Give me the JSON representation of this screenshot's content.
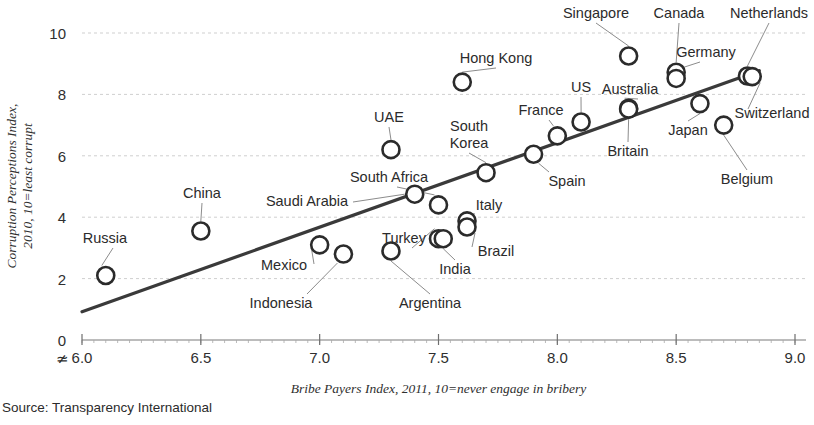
{
  "source_note": "Source: Transparency International",
  "chart_data": {
    "type": "scatter",
    "title": "",
    "xlabel": "Bribe Payers Index, 2011, 10=never engage in bribery",
    "ylabel": "Corruption Perceptions Index, 2010, 10=least corrupt",
    "ylabel_line1": "Corruption Perceptions Index,",
    "ylabel_line2": "2010, 10=least corrupt",
    "xlim": [
      6.0,
      9.0
    ],
    "ylim": [
      0,
      10
    ],
    "xticks": [
      "6.0",
      "6.5",
      "7.0",
      "7.5",
      "8.0",
      "8.5",
      "9.0"
    ],
    "xtick_values": [
      6.0,
      6.5,
      7.0,
      7.5,
      8.0,
      8.5,
      9.0
    ],
    "yticks": [
      "0",
      "2",
      "4",
      "6",
      "8",
      "10"
    ],
    "ytick_values": [
      0,
      2,
      4,
      6,
      8,
      10
    ],
    "grid": true,
    "axis_break": true,
    "legend": "none",
    "trendline": {
      "x": [
        6.0,
        8.85
      ],
      "y": [
        0.92,
        8.77
      ]
    },
    "points": [
      {
        "label": "Russia",
        "x": 6.1,
        "y": 2.1,
        "label_pos": "above-left"
      },
      {
        "label": "China",
        "x": 6.5,
        "y": 3.55,
        "label_pos": "above"
      },
      {
        "label": "Mexico",
        "x": 7.0,
        "y": 3.1,
        "label_pos": "left-below"
      },
      {
        "label": "Indonesia",
        "x": 7.1,
        "y": 2.8,
        "label_pos": "below-left"
      },
      {
        "label": "UAE",
        "x": 7.3,
        "y": 6.2,
        "label_pos": "above"
      },
      {
        "label": "Argentina",
        "x": 7.3,
        "y": 2.9,
        "label_pos": "below"
      },
      {
        "label": "Saudi Arabia",
        "x": 7.4,
        "y": 4.75,
        "label_pos": "left"
      },
      {
        "label": "South Africa",
        "x": 7.5,
        "y": 4.4,
        "label_pos": "above-left"
      },
      {
        "label": "Turkey",
        "x": 7.5,
        "y": 3.3,
        "label_pos": "above-left"
      },
      {
        "label": "India",
        "x": 7.52,
        "y": 3.3,
        "label_pos": "below"
      },
      {
        "label": "Hong Kong",
        "x": 7.6,
        "y": 8.4,
        "label_pos": "above"
      },
      {
        "label": "Italy",
        "x": 7.62,
        "y": 3.88,
        "label_pos": "right-above"
      },
      {
        "label": "Brazil",
        "x": 7.62,
        "y": 3.68,
        "label_pos": "right-below"
      },
      {
        "label": "South Korea",
        "x": 7.7,
        "y": 5.45,
        "label_pos": "above"
      },
      {
        "label": "Spain",
        "x": 7.9,
        "y": 6.05,
        "label_pos": "below-right"
      },
      {
        "label": "France",
        "x": 8.0,
        "y": 6.65,
        "label_pos": "above-left"
      },
      {
        "label": "US",
        "x": 8.1,
        "y": 7.1,
        "label_pos": "above"
      },
      {
        "label": "Singapore",
        "x": 8.3,
        "y": 9.25,
        "label_pos": "above"
      },
      {
        "label": "Australia",
        "x": 8.3,
        "y": 7.55,
        "label_pos": "above-left"
      },
      {
        "label": "Britain",
        "x": 8.3,
        "y": 7.52,
        "label_pos": "below"
      },
      {
        "label": "Canada",
        "x": 8.5,
        "y": 8.72,
        "label_pos": "above"
      },
      {
        "label": "Germany",
        "x": 8.5,
        "y": 8.52,
        "label_pos": "above-right"
      },
      {
        "label": "Japan",
        "x": 8.6,
        "y": 7.7,
        "label_pos": "below"
      },
      {
        "label": "Belgium",
        "x": 8.7,
        "y": 7.0,
        "label_pos": "below"
      },
      {
        "label": "Netherlands",
        "x": 8.8,
        "y": 8.6,
        "label_pos": "above"
      },
      {
        "label": "Switzerland",
        "x": 8.82,
        "y": 8.58,
        "label_pos": "right-below"
      }
    ],
    "annotations": [
      {
        "text": "Russia",
        "x": 105,
        "y": 243
      },
      {
        "text": "China",
        "x": 202,
        "y": 198
      },
      {
        "text": "Mexico",
        "x": 284,
        "y": 270
      },
      {
        "text": "Indonesia",
        "x": 281,
        "y": 308
      },
      {
        "text": "UAE",
        "x": 389,
        "y": 122
      },
      {
        "text": "Argentina",
        "x": 430,
        "y": 308
      },
      {
        "text": "Saudi Arabia",
        "x": 307,
        "y": 206
      },
      {
        "text": "South Africa",
        "x": 389,
        "y": 182
      },
      {
        "text": "Turkey",
        "x": 404,
        "y": 243
      },
      {
        "text": "India",
        "x": 455,
        "y": 274
      },
      {
        "text": "Hong Kong",
        "x": 496,
        "y": 63
      },
      {
        "text": "Italy",
        "x": 489,
        "y": 210
      },
      {
        "text": "Brazil",
        "x": 496,
        "y": 256
      },
      {
        "text": "South Korea",
        "x": 469,
        "y": 131
      },
      {
        "text": "Spain",
        "x": 567,
        "y": 186
      },
      {
        "text": "France",
        "x": 541,
        "y": 115
      },
      {
        "text": "US",
        "x": 581,
        "y": 92
      },
      {
        "text": "Singapore",
        "x": 596,
        "y": 18
      },
      {
        "text": "Australia",
        "x": 630,
        "y": 94
      },
      {
        "text": "Britain",
        "x": 628,
        "y": 156
      },
      {
        "text": "Canada",
        "x": 679,
        "y": 18
      },
      {
        "text": "Germany",
        "x": 706,
        "y": 57
      },
      {
        "text": "Japan",
        "x": 688,
        "y": 135
      },
      {
        "text": "Belgium",
        "x": 747,
        "y": 184
      },
      {
        "text": "Netherlands",
        "x": 769,
        "y": 18
      },
      {
        "text": "Switzerland",
        "x": 772,
        "y": 118
      }
    ]
  }
}
